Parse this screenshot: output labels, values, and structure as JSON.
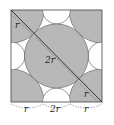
{
  "diagram": {
    "type": "geometry",
    "colors": {
      "shade": "#b8b8b8",
      "background": "#ffffff",
      "stroke": "#333333"
    },
    "labels": {
      "diagonal_top_r": "r",
      "center_2r": "2r",
      "diagonal_bottom_r": "r",
      "bottom_left_r": "r",
      "bottom_middle_2r": "2r",
      "bottom_right_r": "r"
    }
  }
}
